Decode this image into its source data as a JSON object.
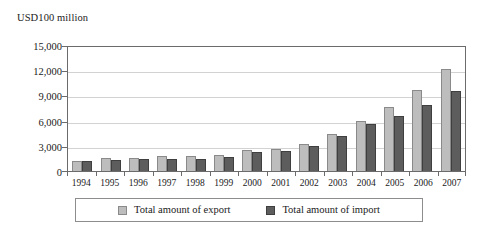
{
  "chart_data": {
    "type": "bar",
    "title": "",
    "subtitle": "",
    "unit_label": "USD100 million",
    "xlabel": "",
    "ylabel": "USD100 million",
    "categories": [
      "1994",
      "1995",
      "1996",
      "1997",
      "1998",
      "1999",
      "2000",
      "2001",
      "2002",
      "2003",
      "2004",
      "2005",
      "2006",
      "2007"
    ],
    "series": [
      {
        "name": "Total amount of export",
        "color": "#bdbdbd",
        "values": [
          1210,
          1490,
          1510,
          1830,
          1840,
          1950,
          2492,
          2661,
          3256,
          4382,
          5934,
          7620,
          9690,
          12180
        ]
      },
      {
        "name": "Total amount of import",
        "color": "#5d5d5d",
        "values": [
          1156,
          1320,
          1388,
          1424,
          1402,
          1657,
          2251,
          2436,
          2952,
          4128,
          5612,
          6600,
          7915,
          9560
        ]
      }
    ],
    "ylim": [
      0,
      15000
    ],
    "yticks": [
      0,
      3000,
      6000,
      9000,
      12000,
      15000
    ],
    "ytick_labels": [
      "0",
      "3,000",
      "6,000",
      "9,000",
      "12,000",
      "15,000"
    ],
    "grid": true,
    "grid_axis": "y",
    "legend_position": "bottom",
    "legend": [
      {
        "label": "Total amount of export",
        "swatch": "export"
      },
      {
        "label": "Total amount of import",
        "swatch": "import"
      }
    ]
  }
}
